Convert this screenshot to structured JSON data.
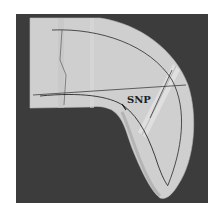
{
  "image": {
    "description": "Grayscale photograph of a curved collar pattern piece on a dark background with drafted lines",
    "label": "SNP"
  },
  "colors": {
    "page_bg": "#ffffff",
    "photo_bg": "#3c3c3c",
    "fabric": "#cfcfcf",
    "fabric_shadow": "#b4b4b4",
    "strip": "#dedede",
    "line": "#2a2a2a"
  }
}
